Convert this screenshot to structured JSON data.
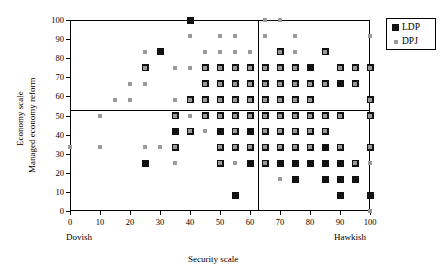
{
  "chart_data": {
    "type": "scatter",
    "title": "",
    "xlabel": "Security scale",
    "ylabel_line1": "Economy scale",
    "ylabel_line2": "Managed economy reform",
    "xlim": [
      0,
      100
    ],
    "ylim": [
      0,
      100
    ],
    "xticks": [
      0,
      10,
      20,
      30,
      40,
      50,
      60,
      70,
      80,
      90,
      100
    ],
    "yticks": [
      0,
      10,
      20,
      30,
      40,
      50,
      60,
      70,
      80,
      90,
      100
    ],
    "xtick_labels": [
      "0",
      "10",
      "20",
      "30",
      "40",
      "50",
      "60",
      "70",
      "80",
      "90",
      "100"
    ],
    "ytick_labels": [
      "0",
      "10",
      "20",
      "30",
      "40",
      "50",
      "60",
      "70",
      "80",
      "90",
      "100"
    ],
    "x_axis_low_label": "Dovish",
    "x_axis_high_label": "Hawkish",
    "grid": false,
    "legend_position": "outside-top-right",
    "reference_lines": {
      "vertical_x": 62.5,
      "horizontal_y": 53
    },
    "colors": {
      "ldp": "#111111",
      "dpj": "#9a9a9a",
      "axis": "#000000",
      "background": "#ffffff"
    },
    "series": [
      {
        "name": "LDP",
        "marker": "square",
        "color": "#111111",
        "marker_size": 7,
        "points": [
          [
            30,
            83.3
          ],
          [
            70,
            83.3
          ],
          [
            85,
            83.3
          ],
          [
            25,
            75
          ],
          [
            45,
            75
          ],
          [
            50,
            75
          ],
          [
            55,
            75
          ],
          [
            60,
            75
          ],
          [
            65,
            75
          ],
          [
            70,
            75
          ],
          [
            75,
            75
          ],
          [
            80,
            75
          ],
          [
            90,
            75
          ],
          [
            95,
            75
          ],
          [
            100,
            75
          ],
          [
            45,
            66.7
          ],
          [
            50,
            66.7
          ],
          [
            55,
            66.7
          ],
          [
            60,
            66.7
          ],
          [
            65,
            66.7
          ],
          [
            70,
            66.7
          ],
          [
            75,
            66.7
          ],
          [
            80,
            66.7
          ],
          [
            85,
            66.7
          ],
          [
            90,
            66.7
          ],
          [
            95,
            66.7
          ],
          [
            40,
            58.3
          ],
          [
            45,
            58.3
          ],
          [
            50,
            58.3
          ],
          [
            55,
            58.3
          ],
          [
            60,
            58.3
          ],
          [
            65,
            58.3
          ],
          [
            70,
            58.3
          ],
          [
            75,
            58.3
          ],
          [
            80,
            58.3
          ],
          [
            100,
            58.3
          ],
          [
            35,
            50
          ],
          [
            45,
            50
          ],
          [
            50,
            50
          ],
          [
            55,
            50
          ],
          [
            60,
            50
          ],
          [
            65,
            50
          ],
          [
            70,
            50
          ],
          [
            75,
            50
          ],
          [
            80,
            50
          ],
          [
            85,
            50
          ],
          [
            90,
            50
          ],
          [
            100,
            50
          ],
          [
            35,
            41.7
          ],
          [
            40,
            41.7
          ],
          [
            50,
            41.7
          ],
          [
            55,
            41.7
          ],
          [
            60,
            41.7
          ],
          [
            65,
            41.7
          ],
          [
            70,
            41.7
          ],
          [
            75,
            41.7
          ],
          [
            80,
            41.7
          ],
          [
            85,
            41.7
          ],
          [
            35,
            33.3
          ],
          [
            50,
            33.3
          ],
          [
            55,
            33.3
          ],
          [
            60,
            33.3
          ],
          [
            65,
            33.3
          ],
          [
            70,
            33.3
          ],
          [
            75,
            33.3
          ],
          [
            80,
            33.3
          ],
          [
            85,
            33.3
          ],
          [
            90,
            33.3
          ],
          [
            100,
            33.3
          ],
          [
            25,
            25
          ],
          [
            50,
            25
          ],
          [
            60,
            25
          ],
          [
            65,
            25
          ],
          [
            70,
            25
          ],
          [
            75,
            25
          ],
          [
            80,
            25
          ],
          [
            85,
            25
          ],
          [
            90,
            25
          ],
          [
            95,
            25
          ],
          [
            75,
            16.7
          ],
          [
            85,
            16.7
          ],
          [
            90,
            16.7
          ],
          [
            95,
            16.7
          ],
          [
            55,
            8.3
          ],
          [
            90,
            8.3
          ],
          [
            100,
            8.3
          ],
          [
            40,
            100
          ]
        ]
      },
      {
        "name": "DPJ",
        "marker": "square",
        "color": "#9a9a9a",
        "marker_size": 4,
        "points": [
          [
            65,
            100
          ],
          [
            70,
            100
          ],
          [
            40,
            91.7
          ],
          [
            50,
            91.7
          ],
          [
            55,
            91.7
          ],
          [
            65,
            91.7
          ],
          [
            75,
            91.7
          ],
          [
            100,
            91.7
          ],
          [
            25,
            83.3
          ],
          [
            45,
            83.3
          ],
          [
            50,
            83.3
          ],
          [
            55,
            83.3
          ],
          [
            60,
            83.3
          ],
          [
            70,
            83.3
          ],
          [
            75,
            83.3
          ],
          [
            85,
            83.3
          ],
          [
            25,
            75
          ],
          [
            35,
            75
          ],
          [
            40,
            75
          ],
          [
            45,
            75
          ],
          [
            50,
            75
          ],
          [
            55,
            75
          ],
          [
            60,
            75
          ],
          [
            65,
            75
          ],
          [
            70,
            75
          ],
          [
            75,
            75
          ],
          [
            90,
            75
          ],
          [
            95,
            75
          ],
          [
            100,
            75
          ],
          [
            20,
            66.7
          ],
          [
            25,
            66.7
          ],
          [
            45,
            66.7
          ],
          [
            50,
            66.7
          ],
          [
            55,
            66.7
          ],
          [
            60,
            66.7
          ],
          [
            65,
            66.7
          ],
          [
            70,
            66.7
          ],
          [
            75,
            66.7
          ],
          [
            80,
            66.7
          ],
          [
            85,
            66.7
          ],
          [
            95,
            66.7
          ],
          [
            15,
            58.3
          ],
          [
            20,
            58.3
          ],
          [
            35,
            58.3
          ],
          [
            40,
            58.3
          ],
          [
            45,
            58.3
          ],
          [
            50,
            58.3
          ],
          [
            55,
            58.3
          ],
          [
            60,
            58.3
          ],
          [
            65,
            58.3
          ],
          [
            70,
            58.3
          ],
          [
            75,
            58.3
          ],
          [
            80,
            58.3
          ],
          [
            100,
            58.3
          ],
          [
            10,
            50
          ],
          [
            35,
            50
          ],
          [
            40,
            50
          ],
          [
            45,
            50
          ],
          [
            50,
            50
          ],
          [
            55,
            50
          ],
          [
            60,
            50
          ],
          [
            65,
            50
          ],
          [
            70,
            50
          ],
          [
            75,
            50
          ],
          [
            80,
            50
          ],
          [
            85,
            50
          ],
          [
            90,
            50
          ],
          [
            100,
            50
          ],
          [
            40,
            41.7
          ],
          [
            45,
            41.7
          ],
          [
            55,
            41.7
          ],
          [
            65,
            41.7
          ],
          [
            70,
            41.7
          ],
          [
            75,
            41.7
          ],
          [
            80,
            41.7
          ],
          [
            85,
            41.7
          ],
          [
            0,
            33.3
          ],
          [
            10,
            33.3
          ],
          [
            25,
            33.3
          ],
          [
            30,
            33.3
          ],
          [
            35,
            33.3
          ],
          [
            50,
            33.3
          ],
          [
            55,
            33.3
          ],
          [
            60,
            33.3
          ],
          [
            65,
            33.3
          ],
          [
            70,
            33.3
          ],
          [
            75,
            33.3
          ],
          [
            80,
            33.3
          ],
          [
            90,
            33.3
          ],
          [
            100,
            33.3
          ],
          [
            35,
            25
          ],
          [
            50,
            25
          ],
          [
            55,
            25
          ],
          [
            65,
            25
          ],
          [
            95,
            25
          ],
          [
            100,
            25
          ],
          [
            70,
            16.7
          ],
          [
            100,
            0
          ]
        ]
      }
    ]
  },
  "legend": {
    "items": [
      {
        "label": "LDP",
        "series": "ldp"
      },
      {
        "label": "DPJ",
        "series": "dpj"
      }
    ]
  }
}
